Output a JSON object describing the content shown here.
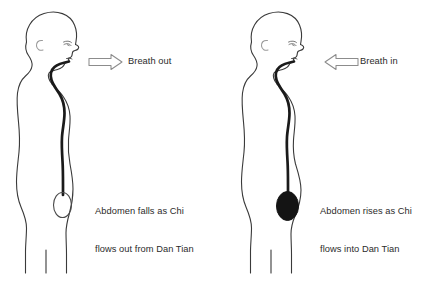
{
  "diagram": {
    "background_color": "#ffffff",
    "outline_color": "#3a3a3a",
    "channel_color": "#1a1a1a",
    "text_color": "#2b2b2b",
    "panels": [
      {
        "id": "exhale",
        "side": "left",
        "breath_label": "Breath out",
        "arrow_direction": "right",
        "arrow_style": "hollow-outline",
        "dan_tian_fill": "empty",
        "caption_line1": "Abdomen falls as Chi",
        "caption_line2": "flows out from Dan Tian"
      },
      {
        "id": "inhale",
        "side": "right",
        "breath_label": "Breath in",
        "arrow_direction": "left",
        "arrow_style": "hollow-outline",
        "dan_tian_fill": "filled",
        "caption_line1": "Abdomen rises as Chi",
        "caption_line2": "flows into Dan Tian"
      }
    ],
    "figure_parts": [
      "head-profile",
      "ear",
      "eye",
      "nose",
      "lips",
      "chin",
      "neck",
      "torso-outline",
      "chi-channel",
      "dan-tian",
      "legs"
    ]
  }
}
